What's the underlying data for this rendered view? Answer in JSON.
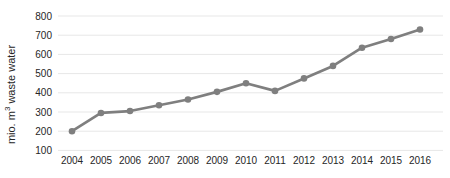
{
  "chart": {
    "ylabel_parts": {
      "pre": "mio. m",
      "sup": "3",
      "post": " waste water"
    }
  },
  "chart_data": {
    "type": "line",
    "title": "",
    "xlabel": "",
    "ylabel": "mio. m3 waste water",
    "categories": [
      "2004",
      "2005",
      "2006",
      "2007",
      "2008",
      "2009",
      "2010",
      "2011",
      "2012",
      "2013",
      "2014",
      "2015",
      "2016"
    ],
    "values": [
      200,
      295,
      305,
      335,
      365,
      405,
      450,
      410,
      475,
      540,
      635,
      680,
      730
    ],
    "ylim": [
      100,
      800
    ],
    "ytick_step": 100,
    "yticks": [
      100,
      200,
      300,
      400,
      500,
      600,
      700,
      800
    ],
    "grid": true,
    "legend": "none",
    "marker": "circle",
    "colors": {
      "line": "#7f7f7f",
      "marker": "#7f7f7f",
      "grid": "#e7e7e7",
      "tick_text": "#262626",
      "background": "#ffffff"
    }
  }
}
